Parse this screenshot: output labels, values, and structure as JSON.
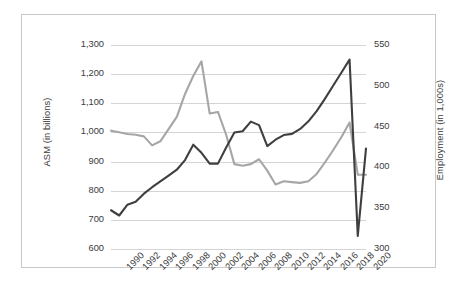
{
  "chart_data": {
    "type": "line",
    "title": "",
    "subtitle": "",
    "xlabel": "",
    "grid": "horizontal",
    "legend": "none",
    "x": [
      1990,
      1991,
      1992,
      1993,
      1994,
      1995,
      1996,
      1997,
      1998,
      1999,
      2000,
      2001,
      2002,
      2003,
      2004,
      2005,
      2006,
      2007,
      2008,
      2009,
      2010,
      2011,
      2012,
      2013,
      2014,
      2015,
      2016,
      2017,
      2018,
      2019,
      2020,
      2021
    ],
    "xtick_labels": [
      "1990",
      "1992",
      "1994",
      "1996",
      "1998",
      "2000",
      "2002",
      "2004",
      "2006",
      "2008",
      "2010",
      "2012",
      "2014",
      "2016",
      "2018",
      "2020"
    ],
    "xtick_values": [
      1990,
      1992,
      1994,
      1996,
      1998,
      2000,
      2002,
      2004,
      2006,
      2008,
      2010,
      2012,
      2014,
      2016,
      2018,
      2020
    ],
    "xlim": [
      1990,
      2021
    ],
    "axes": [
      {
        "id": "left",
        "ylabel": "ASM (in billions)",
        "ylim": [
          600,
          1300
        ],
        "ytick_labels": [
          "1,300",
          "1,200",
          "1,100",
          "1,000",
          "900",
          "800",
          "700",
          "600"
        ],
        "ytick_values": [
          1300,
          1200,
          1100,
          1000,
          900,
          800,
          700,
          600
        ]
      },
      {
        "id": "right",
        "ylabel": "Employment (in 1,000s)",
        "ylim": [
          300,
          550
        ],
        "ytick_labels": [
          "550",
          "500",
          "450",
          "400",
          "350",
          "300"
        ],
        "ytick_values": [
          550,
          500,
          450,
          400,
          350,
          300
        ]
      }
    ],
    "series": [
      {
        "name": "ASM (in billions)",
        "axis": "left",
        "color": "#3f3f3f",
        "values": [
          733,
          715,
          752,
          762,
          790,
          812,
          832,
          852,
          872,
          905,
          958,
          930,
          893,
          893,
          948,
          1000,
          1004,
          1037,
          1025,
          953,
          975,
          991,
          995,
          1012,
          1038,
          1073,
          1115,
          1160,
          1205,
          1250,
          645,
          945
        ]
      },
      {
        "name": "Employment (in 1,000s)",
        "axis": "right",
        "color": "#a6a6a6",
        "values": [
          445,
          443,
          441,
          440,
          438,
          427,
          432,
          447,
          462,
          490,
          512,
          530,
          466,
          468,
          440,
          404,
          402,
          404,
          410,
          396,
          379,
          383,
          382,
          381,
          383,
          392,
          406,
          421,
          437,
          455,
          391,
          391
        ]
      }
    ]
  }
}
